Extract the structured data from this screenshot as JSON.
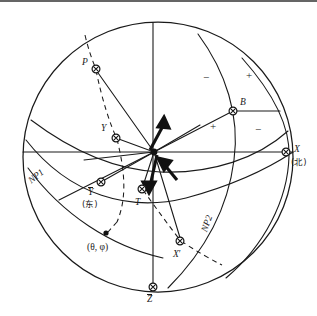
{
  "figure": {
    "kind": "stereographic-projection",
    "background": "#ffffff",
    "line_color": "#1a1a1a",
    "primitive_circle": {
      "cx": 158,
      "cy": 157,
      "r": 135
    }
  },
  "labels": {
    "p": "P",
    "b": "B",
    "y": "Y",
    "y_bar": "Y",
    "y_bar_cjk": "(东)",
    "x": "X",
    "x_cjk": "(北)",
    "x_prime": "X",
    "z_bar": "Z",
    "t": "T",
    "np1": "NP1",
    "np2": "NP2",
    "theta_phi": "(θ, φ)"
  },
  "quadrant_signs": [
    {
      "text": "−",
      "x": 206,
      "y": 78
    },
    {
      "text": "+",
      "x": 249,
      "y": 76
    },
    {
      "text": "+",
      "x": 213,
      "y": 127
    },
    {
      "text": "−",
      "x": 258,
      "y": 130
    }
  ],
  "points": [
    {
      "name": "P",
      "cx": 96,
      "cy": 69,
      "style": "ring"
    },
    {
      "name": "B",
      "cx": 233,
      "cy": 111,
      "style": "ring"
    },
    {
      "name": "Y",
      "cx": 116,
      "cy": 138,
      "style": "ring"
    },
    {
      "name": "center",
      "cx": 154,
      "cy": 152,
      "style": "solid"
    },
    {
      "name": "X",
      "cx": 286,
      "cy": 152,
      "style": "ring"
    },
    {
      "name": "Y-bar",
      "cx": 101,
      "cy": 182,
      "style": "ring"
    },
    {
      "name": "T",
      "cx": 142,
      "cy": 189,
      "style": "ring"
    },
    {
      "name": "theta-phi",
      "cx": 106,
      "cy": 233,
      "style": "dot"
    },
    {
      "name": "X-prime",
      "cx": 180,
      "cy": 241,
      "style": "ring"
    },
    {
      "name": "Z-bar",
      "cx": 153,
      "cy": 287,
      "style": "ring"
    }
  ],
  "arrows": [
    {
      "name": "compression-arrow-upper",
      "from": [
        150,
        150
      ],
      "to": [
        163,
        121
      ]
    },
    {
      "name": "tension-arrow-lower-left",
      "from": [
        156,
        156
      ],
      "to": [
        149,
        190
      ]
    },
    {
      "name": "tension-arrow-lower-right",
      "from": [
        175,
        178
      ],
      "to": [
        160,
        160
      ]
    }
  ]
}
